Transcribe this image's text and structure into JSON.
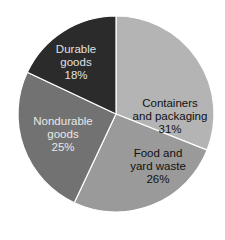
{
  "chart_data": {
    "type": "pie",
    "title": "",
    "start_angle_deg": 0,
    "direction": "clockwise",
    "slices": [
      {
        "name": "Containers and packaging",
        "line1": "Containers",
        "line2": "and packaging",
        "value": 31,
        "label": "31%",
        "color": "#b4b4b4",
        "text_color": "#111111"
      },
      {
        "name": "Food and yard waste",
        "line1": "Food and",
        "line2": "yard waste",
        "value": 26,
        "label": "26%",
        "color": "#9a9a9a",
        "text_color": "#111111"
      },
      {
        "name": "Nondurable goods",
        "line1": "Nondurable",
        "line2": "goods",
        "value": 25,
        "label": "25%",
        "color": "#727272",
        "text_color": "#e8e8e8"
      },
      {
        "name": "Durable goods",
        "line1": "Durable",
        "line2": "goods",
        "value": 18,
        "label": "18%",
        "color": "#2b2b2b",
        "text_color": "#e0e0e0"
      }
    ],
    "legend": "none (labels inside slices)",
    "separator_color": "#ffffff"
  }
}
